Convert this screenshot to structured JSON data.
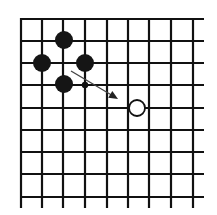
{
  "diagram": {
    "type": "go-board-fragment",
    "grid": {
      "vertical_x": [
        21,
        42,
        63,
        85,
        107,
        128,
        149,
        171,
        193
      ],
      "horizontal_y": [
        19,
        41,
        63,
        85,
        108,
        130,
        152,
        174,
        197
      ],
      "x_start": 20,
      "x_end": 204,
      "y_start": 18,
      "y_end": 208,
      "line_color": "#111111"
    },
    "black_stones": [
      {
        "x": 64,
        "y": 40
      },
      {
        "x": 42,
        "y": 63
      },
      {
        "x": 85,
        "y": 63
      },
      {
        "x": 64,
        "y": 84
      }
    ],
    "white_stones": [
      {
        "x": 137,
        "y": 108
      }
    ],
    "marker_dot": {
      "x": 85,
      "y": 85
    },
    "arrow": {
      "from": [
        71,
        71
      ],
      "to": [
        118,
        99
      ]
    },
    "colors": {
      "black": "#151515",
      "white": "#ffffff",
      "line": "#111111"
    }
  }
}
